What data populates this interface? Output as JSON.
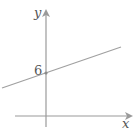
{
  "diagram": {
    "type": "linear-function-graph",
    "axes": {
      "x_label": "x",
      "y_label": "y",
      "color": "#9a9a9a"
    },
    "line": {
      "y_intercept_label": "6",
      "slope_sign": "positive",
      "color": "#9a9a9a"
    },
    "label_color": "#555555"
  }
}
